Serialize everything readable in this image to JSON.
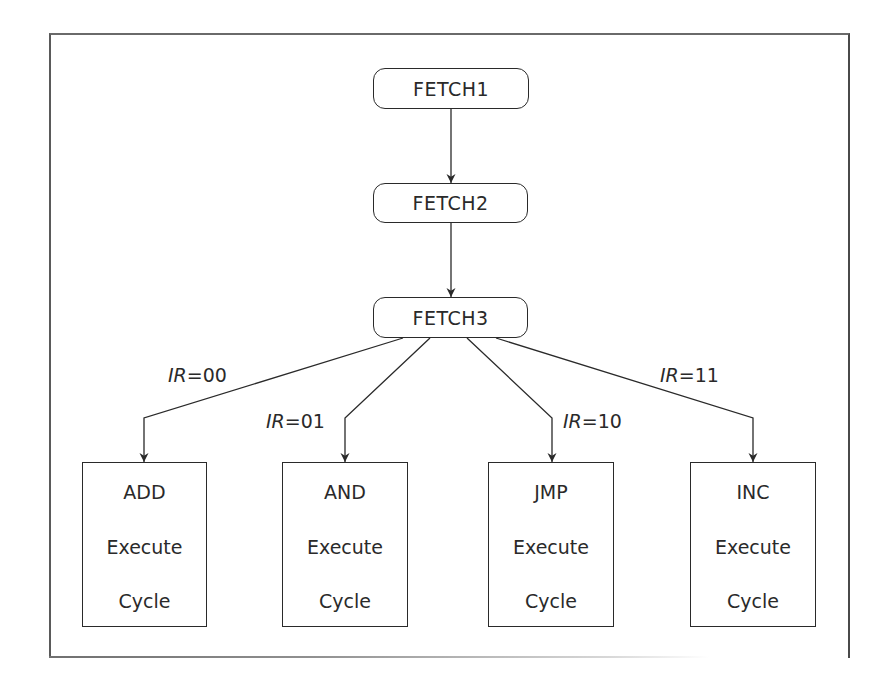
{
  "diagram": {
    "type": "state-flowchart",
    "fetch_states": [
      {
        "id": "fetch1",
        "label": "FETCH1"
      },
      {
        "id": "fetch2",
        "label": "FETCH2"
      },
      {
        "id": "fetch3",
        "label": "FETCH3"
      }
    ],
    "branch_variable": "IR",
    "branches": [
      {
        "condition_var": "IR",
        "condition_eq": "=",
        "condition_value": "00",
        "target": {
          "name": "ADD",
          "line2": "Execute",
          "line3": "Cycle"
        }
      },
      {
        "condition_var": "IR",
        "condition_eq": "=",
        "condition_value": "01",
        "target": {
          "name": "AND",
          "line2": "Execute",
          "line3": "Cycle"
        }
      },
      {
        "condition_var": "IR",
        "condition_eq": "=",
        "condition_value": "10",
        "target": {
          "name": "JMP",
          "line2": "Execute",
          "line3": "Cycle"
        }
      },
      {
        "condition_var": "IR",
        "condition_eq": "=",
        "condition_value": "11",
        "target": {
          "name": "INC",
          "line2": "Execute",
          "line3": "Cycle"
        }
      }
    ],
    "edges": [
      {
        "from": "FETCH1",
        "to": "FETCH2"
      },
      {
        "from": "FETCH2",
        "to": "FETCH3"
      },
      {
        "from": "FETCH3",
        "to": "ADD",
        "label": "IR=00"
      },
      {
        "from": "FETCH3",
        "to": "AND",
        "label": "IR=01"
      },
      {
        "from": "FETCH3",
        "to": "JMP",
        "label": "IR=10"
      },
      {
        "from": "FETCH3",
        "to": "INC",
        "label": "IR=11"
      }
    ],
    "colors": {
      "stroke": "#2a2a2a",
      "background": "#ffffff"
    }
  }
}
